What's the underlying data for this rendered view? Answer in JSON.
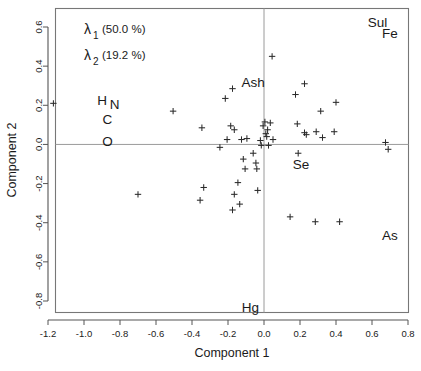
{
  "chart_data": {
    "type": "scatter",
    "title": "",
    "xlabel": "Component 1",
    "ylabel": "Component 2",
    "xlim": [
      -1.28,
      0.82
    ],
    "ylim": [
      -0.88,
      0.66
    ],
    "xticks": [
      "-1.2",
      "-1.0",
      "-0.8",
      "-0.6",
      "-0.4",
      "-0.2",
      "0.0",
      "0.2",
      "0.4",
      "0.6",
      "0.8"
    ],
    "xtickvals": [
      -1.2,
      -1.0,
      -0.8,
      -0.6,
      -0.4,
      -0.2,
      0.0,
      0.2,
      0.4,
      0.6,
      0.8
    ],
    "yticks": [
      "0.6",
      "0.4",
      "0.2",
      "0.0",
      "-0.2",
      "-0.4",
      "-0.6",
      "-0.8"
    ],
    "ytickvals": [
      0.6,
      0.4,
      0.2,
      0.0,
      -0.2,
      -0.4,
      -0.6,
      -0.8
    ],
    "grid": false,
    "zero_lines": true,
    "legend_position": "top-left",
    "marker": "plus",
    "annotations": [
      {
        "text": "Sul",
        "x": 0.63,
        "y": 0.625
      },
      {
        "text": "Fe",
        "x": 0.7,
        "y": 0.565
      },
      {
        "text": "Ash",
        "x": -0.06,
        "y": 0.315
      },
      {
        "text": "H",
        "x": -0.9,
        "y": 0.225
      },
      {
        "text": "N",
        "x": -0.83,
        "y": 0.205
      },
      {
        "text": "C",
        "x": -0.87,
        "y": 0.125
      },
      {
        "text": "O",
        "x": -0.87,
        "y": 0.015
      },
      {
        "text": "Se",
        "x": 0.205,
        "y": -0.105
      },
      {
        "text": "As",
        "x": 0.7,
        "y": -0.465
      },
      {
        "text": "Hg",
        "x": -0.075,
        "y": -0.835
      }
    ],
    "eigen_legend": [
      {
        "symbol": "λ",
        "sub": "1",
        "pct": "(50.0 %)"
      },
      {
        "symbol": "λ",
        "sub": "2",
        "pct": "(19.2 %)"
      }
    ],
    "points": [
      {
        "x": -1.17,
        "y": 0.21
      },
      {
        "x": -0.7,
        "y": -0.255
      },
      {
        "x": -0.505,
        "y": 0.17
      },
      {
        "x": -0.345,
        "y": 0.085
      },
      {
        "x": -0.335,
        "y": -0.22
      },
      {
        "x": -0.355,
        "y": -0.285
      },
      {
        "x": -0.245,
        "y": -0.015
      },
      {
        "x": -0.215,
        "y": 0.235
      },
      {
        "x": -0.205,
        "y": 0.025
      },
      {
        "x": -0.185,
        "y": 0.095
      },
      {
        "x": -0.175,
        "y": 0.285
      },
      {
        "x": -0.165,
        "y": 0.075
      },
      {
        "x": -0.165,
        "y": -0.255
      },
      {
        "x": -0.175,
        "y": -0.335
      },
      {
        "x": -0.145,
        "y": -0.195
      },
      {
        "x": -0.135,
        "y": -0.305
      },
      {
        "x": -0.125,
        "y": 0.025
      },
      {
        "x": -0.115,
        "y": -0.075
      },
      {
        "x": -0.105,
        "y": -0.125
      },
      {
        "x": -0.095,
        "y": 0.03
      },
      {
        "x": -0.06,
        "y": -0.045
      },
      {
        "x": -0.045,
        "y": -0.095
      },
      {
        "x": -0.04,
        "y": -0.125
      },
      {
        "x": -0.035,
        "y": -0.235
      },
      {
        "x": -0.02,
        "y": 0.02
      },
      {
        "x": -0.015,
        "y": -0.005
      },
      {
        "x": -0.005,
        "y": 0.095
      },
      {
        "x": 0.005,
        "y": 0.115
      },
      {
        "x": 0.01,
        "y": 0.055
      },
      {
        "x": 0.015,
        "y": 0.04
      },
      {
        "x": 0.02,
        "y": 0.075
      },
      {
        "x": 0.025,
        "y": -0.005
      },
      {
        "x": 0.035,
        "y": 0.11
      },
      {
        "x": 0.045,
        "y": 0.45
      },
      {
        "x": 0.05,
        "y": 0.025
      },
      {
        "x": 0.145,
        "y": -0.37
      },
      {
        "x": 0.175,
        "y": 0.255
      },
      {
        "x": 0.185,
        "y": 0.105
      },
      {
        "x": 0.19,
        "y": -0.045
      },
      {
        "x": 0.225,
        "y": 0.31
      },
      {
        "x": 0.225,
        "y": 0.06
      },
      {
        "x": 0.235,
        "y": 0.05
      },
      {
        "x": 0.285,
        "y": -0.395
      },
      {
        "x": 0.29,
        "y": 0.065
      },
      {
        "x": 0.315,
        "y": 0.17
      },
      {
        "x": 0.325,
        "y": 0.035
      },
      {
        "x": 0.39,
        "y": 0.065
      },
      {
        "x": 0.4,
        "y": 0.215
      },
      {
        "x": 0.42,
        "y": -0.395
      },
      {
        "x": 0.675,
        "y": 0.01
      },
      {
        "x": 0.69,
        "y": -0.025
      }
    ]
  }
}
